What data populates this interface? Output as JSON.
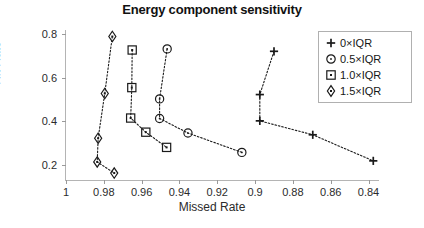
{
  "chart_data": {
    "type": "scatter",
    "title": "Energy component sensitivity",
    "xlabel": "Missed Rate",
    "ylabel": "Hit Rate",
    "xlim": [
      1.0,
      0.835
    ],
    "ylim": [
      0.13,
      0.82
    ],
    "x_ticks": [
      1,
      0.98,
      0.96,
      0.94,
      0.92,
      0.9,
      0.88,
      0.86,
      0.84
    ],
    "x_tick_labels": [
      "1",
      "0.98",
      "0.96",
      "0.94",
      "0.92",
      "0.9",
      "0.88",
      "0.86",
      "0.84"
    ],
    "y_ticks": [
      0.2,
      0.4,
      0.6,
      0.8
    ],
    "y_tick_labels": [
      "0.2",
      "0.4",
      "0.6",
      "0.8"
    ],
    "x_axis_reversed": true,
    "grid": false,
    "legend_position": "top-right",
    "line_style": "dotted",
    "line_color": "#1a1a1a",
    "marker_color": "#1a1a1a",
    "series": [
      {
        "name": "0×IQR",
        "marker": "plus",
        "points": [
          {
            "x": 0.89,
            "y": 0.722
          },
          {
            "x": 0.8975,
            "y": 0.523
          },
          {
            "x": 0.8975,
            "y": 0.402
          },
          {
            "x": 0.8695,
            "y": 0.338
          },
          {
            "x": 0.8375,
            "y": 0.218
          }
        ]
      },
      {
        "name": "0.5×IQR",
        "marker": "circle-dot",
        "points": [
          {
            "x": 0.9465,
            "y": 0.733
          },
          {
            "x": 0.9505,
            "y": 0.503
          },
          {
            "x": 0.9505,
            "y": 0.413
          },
          {
            "x": 0.9355,
            "y": 0.346
          },
          {
            "x": 0.907,
            "y": 0.257
          }
        ]
      },
      {
        "name": "1.0×IQR",
        "marker": "square-dot",
        "points": [
          {
            "x": 0.965,
            "y": 0.728
          },
          {
            "x": 0.9652,
            "y": 0.555
          },
          {
            "x": 0.9658,
            "y": 0.415
          },
          {
            "x": 0.9578,
            "y": 0.35
          },
          {
            "x": 0.9468,
            "y": 0.28
          }
        ]
      },
      {
        "name": "1.5×IQR",
        "marker": "diamond-dot",
        "points": [
          {
            "x": 0.9755,
            "y": 0.79
          },
          {
            "x": 0.9795,
            "y": 0.528
          },
          {
            "x": 0.983,
            "y": 0.322
          },
          {
            "x": 0.9835,
            "y": 0.213
          },
          {
            "x": 0.9745,
            "y": 0.162
          }
        ]
      }
    ]
  },
  "legend": {
    "entries": [
      {
        "label": "0×IQR",
        "marker": "plus"
      },
      {
        "label": "0.5×IQR",
        "marker": "circle-dot"
      },
      {
        "label": "1.0×IQR",
        "marker": "square-dot"
      },
      {
        "label": "1.5×IQR",
        "marker": "diamond-dot"
      }
    ]
  }
}
